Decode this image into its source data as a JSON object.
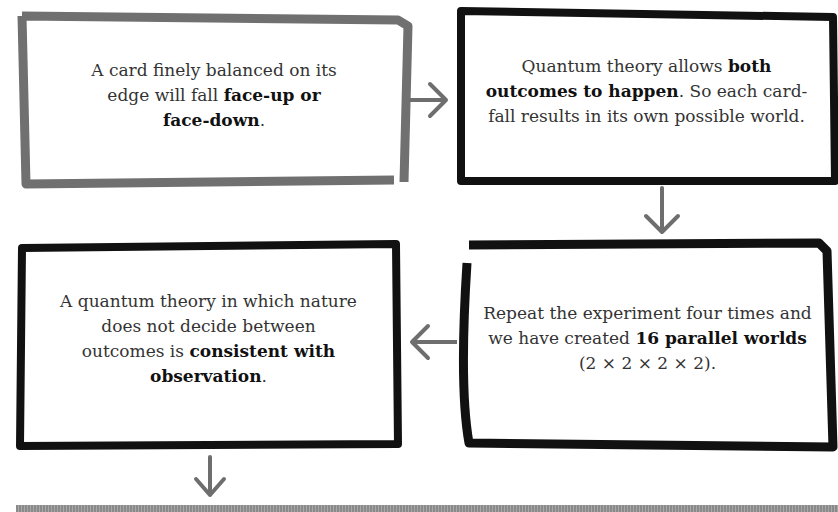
{
  "diagram": {
    "boxes": [
      {
        "id": "box1",
        "border_color": "#707070",
        "parts": [
          {
            "text": "A card finely balanced on its edge will fall ",
            "bold": false
          },
          {
            "text": "face-up or face-down",
            "bold": true
          },
          {
            "text": ".",
            "bold": false
          }
        ]
      },
      {
        "id": "box2",
        "border_color": "#111111",
        "parts": [
          {
            "text": "Quantum theory allows ",
            "bold": false
          },
          {
            "text": "both outcomes to happen",
            "bold": true
          },
          {
            "text": ". So each card-fall results in its own possible world.",
            "bold": false
          }
        ]
      },
      {
        "id": "box3",
        "border_color": "#111111",
        "parts": [
          {
            "text": "A quantum theory in which nature does not decide between outcomes is ",
            "bold": false
          },
          {
            "text": "consistent with observation",
            "bold": true
          },
          {
            "text": ".",
            "bold": false
          }
        ]
      },
      {
        "id": "box4",
        "border_color": "#111111",
        "parts": [
          {
            "text": "Repeat the experiment four times and we have created ",
            "bold": false
          },
          {
            "text": "16 parallel worlds",
            "bold": true
          },
          {
            "text": " (2 × 2 × 2 × 2).",
            "bold": false
          }
        ]
      }
    ],
    "arrows": [
      {
        "from": "box1",
        "to": "box2",
        "direction": "right"
      },
      {
        "from": "box2",
        "to": "box4",
        "direction": "down"
      },
      {
        "from": "box4",
        "to": "box3",
        "direction": "left"
      },
      {
        "from": "box3",
        "to": "next",
        "direction": "down"
      }
    ],
    "arrow_color": "#6e6e6e"
  },
  "text": {
    "box1_a": "A card finely balanced on its edge will fall ",
    "box1_b": "face-up or face-down",
    "box1_c": ".",
    "box2_a": "Quantum theory allows ",
    "box2_b": "both outcomes to happen",
    "box2_c": ". So each card-fall results in its own possible world.",
    "box3_a": "A quantum theory in which nature does not decide between outcomes is ",
    "box3_b": "consistent with observation",
    "box3_c": ".",
    "box4_a": "Repeat the experiment four times and we have created ",
    "box4_b": "16 parallel worlds",
    "box4_c": " (2 × 2 × 2 × 2)."
  }
}
